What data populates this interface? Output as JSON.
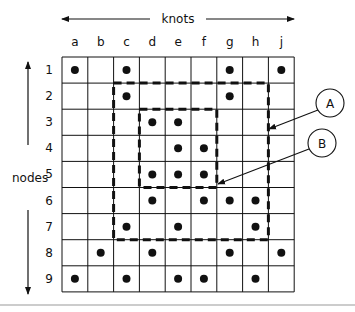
{
  "diagram": {
    "top_axis_label": "knots",
    "side_axis_label": "nodes",
    "columns": [
      "a",
      "b",
      "c",
      "d",
      "e",
      "f",
      "g",
      "h",
      "j"
    ],
    "rows": [
      "1",
      "2",
      "3",
      "4",
      "5",
      "6",
      "7",
      "8",
      "9"
    ],
    "dots": {
      "1": [
        "a",
        "c",
        "g",
        "j"
      ],
      "2": [
        "c",
        "g"
      ],
      "3": [
        "d",
        "e"
      ],
      "4": [
        "e",
        "f"
      ],
      "5": [
        "d",
        "e",
        "f"
      ],
      "6": [
        "d",
        "f",
        "g",
        "h"
      ],
      "7": [
        "c",
        "e",
        "h"
      ],
      "8": [
        "b",
        "d",
        "g",
        "j"
      ],
      "9": [
        "a",
        "c",
        "e",
        "f",
        "h"
      ]
    },
    "regions": [
      {
        "label": "A",
        "from_col": "c",
        "to_col": "h",
        "from_row": "2",
        "to_row": "7"
      },
      {
        "label": "B",
        "from_col": "d",
        "to_col": "f",
        "from_row": "3",
        "to_row": "5"
      }
    ],
    "colors": {
      "line": "#111111",
      "background": "#ffffff",
      "separator": "#999999"
    }
  }
}
